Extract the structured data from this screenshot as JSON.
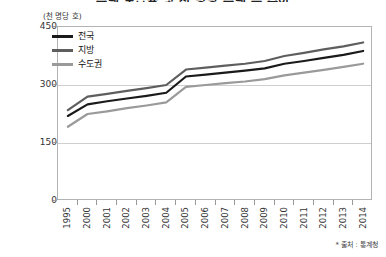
{
  "header": {
    "title": "주택 보급률 및 천 명당 주택 수 추이",
    "unit_label": "(천 명당 호)",
    "footnote": "* 출처 : 통계청"
  },
  "legend": {
    "position": "top-left",
    "items": [
      {
        "label": "전국",
        "color": "#1a1a1a"
      },
      {
        "label": "지방",
        "color": "#5e5e5e"
      },
      {
        "label": "수도권",
        "color": "#9a9a9a"
      }
    ]
  },
  "axes": {
    "y_ticks": [
      "0",
      "150",
      "300",
      "450"
    ],
    "x_ticks": [
      "1995",
      "2000",
      "2001",
      "2002",
      "2003",
      "2004",
      "2005",
      "2006",
      "2007",
      "2008",
      "2009",
      "2010",
      "2011",
      "2012",
      "2013",
      "2014"
    ]
  },
  "chart_data": {
    "type": "line",
    "title": "주택 보급률 및 천 명당 주택 수 추이",
    "xlabel": "",
    "ylabel": "(천 명당 호)",
    "ylim": [
      0,
      450
    ],
    "yticks": [
      0,
      150,
      300,
      450
    ],
    "grid": true,
    "legend_position": "top-left",
    "categories": [
      "1995",
      "2000",
      "2001",
      "2002",
      "2003",
      "2004",
      "2005",
      "2006",
      "2007",
      "2008",
      "2009",
      "2010",
      "2011",
      "2012",
      "2013",
      "2014"
    ],
    "series": [
      {
        "name": "지방",
        "color": "#5e5e5e",
        "values": [
          235,
          270,
          277,
          285,
          292,
          300,
          340,
          345,
          350,
          355,
          362,
          375,
          383,
          392,
          400,
          410
        ]
      },
      {
        "name": "전국",
        "color": "#1a1a1a",
        "values": [
          220,
          250,
          258,
          265,
          272,
          280,
          322,
          327,
          332,
          337,
          343,
          355,
          362,
          370,
          378,
          388
        ]
      },
      {
        "name": "수도권",
        "color": "#9a9a9a",
        "values": [
          192,
          225,
          232,
          240,
          247,
          255,
          295,
          300,
          305,
          309,
          315,
          325,
          332,
          339,
          347,
          355
        ]
      }
    ],
    "annotations": [
      "2004년과 2005년 사이 전 계열 급증"
    ],
    "source": "통계청"
  }
}
